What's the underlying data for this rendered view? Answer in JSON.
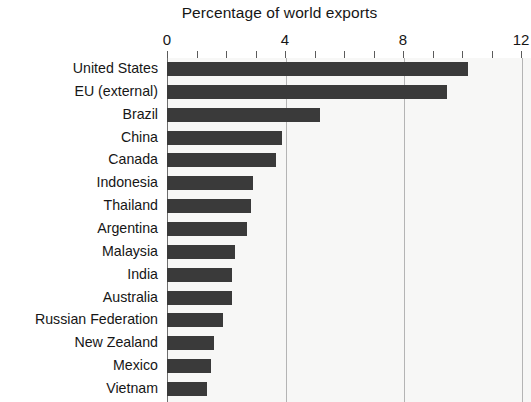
{
  "chart_data": {
    "type": "bar",
    "orientation": "horizontal",
    "title": "Percentage of world exports",
    "xlabel": "",
    "ylabel": "",
    "xlim": [
      0,
      12
    ],
    "xticks": [
      0,
      4,
      8,
      12
    ],
    "xtick_labels": [
      "0",
      "4",
      "8",
      "12"
    ],
    "minor_tick_interval": 1,
    "grid": "vertical gridlines at 4, 8, 12",
    "legend": "none",
    "bar_color": "#3a3a3a",
    "plot_background": "#f7f7f6",
    "categories": [
      "United States",
      "EU (external)",
      "Brazil",
      "China",
      "Canada",
      "Indonesia",
      "Thailand",
      "Argentina",
      "Malaysia",
      "India",
      "Australia",
      "Russian Federation",
      "New Zealand",
      "Mexico",
      "Vietnam"
    ],
    "values": [
      10.2,
      9.5,
      5.2,
      3.9,
      3.7,
      2.9,
      2.85,
      2.7,
      2.3,
      2.2,
      2.2,
      1.9,
      1.6,
      1.5,
      1.35
    ]
  }
}
